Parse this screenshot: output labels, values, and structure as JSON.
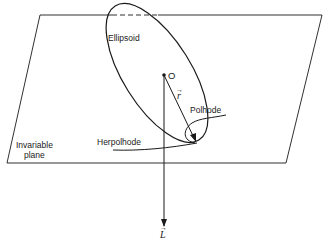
{
  "figure": {
    "colors": {
      "stroke": "#1a1a1a",
      "background": "#ffffff"
    },
    "labels": {
      "ellipsoid": "Ellipsoid",
      "origin": "O",
      "r_vector": "r",
      "polhode": "Polhode",
      "herpolhode": "Herpolhode",
      "plane_line1": "Invariable",
      "plane_line2": "plane",
      "L_vector": "L",
      "arrow_accent": "→"
    }
  }
}
